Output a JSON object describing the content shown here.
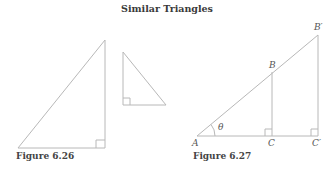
{
  "title": "Similar Triangles",
  "figures": [
    {
      "caption": "Figure 6.26",
      "description": "Two similar right triangles of different size and orientation"
    },
    {
      "caption": "Figure 6.27",
      "description": "Nested right triangles ABC and AB'C' sharing angle theta at A",
      "labels": {
        "A": "A",
        "B": "B",
        "C": "C",
        "B_prime": "B′",
        "C_prime": "C′",
        "theta": "θ"
      }
    }
  ],
  "colors": {
    "line": "#b8b8b8",
    "text": "#444444"
  }
}
